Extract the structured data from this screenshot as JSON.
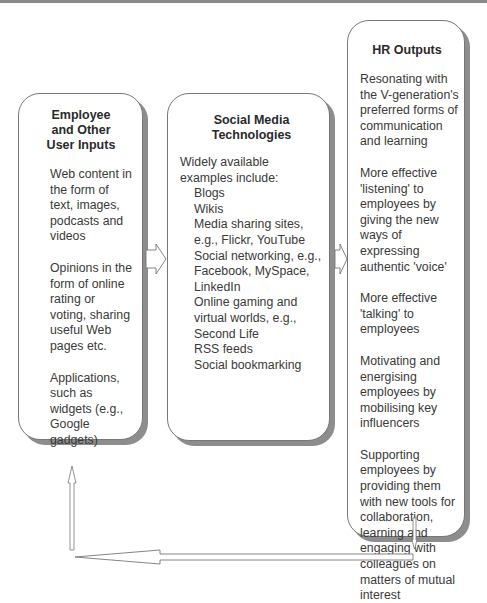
{
  "diagram": {
    "inputs_box": {
      "title": "Employee and Other User Inputs",
      "title_lines": [
        "Employee",
        "and Other",
        "User Inputs"
      ],
      "items": [
        "Web content in the form of text, images, podcasts and videos",
        "Opinions in the form of online rating or voting, sharing useful Web pages etc.",
        "Applications, such as widgets (e.g., Google gadgets)"
      ]
    },
    "tech_box": {
      "title_lines": [
        "Social Media",
        "Technologies"
      ],
      "intro": "Widely available examples include:",
      "examples": [
        "Blogs",
        "Wikis",
        "Media sharing sites, e.g., Flickr, YouTube",
        "Social networking, e.g., Facebook, MySpace, LinkedIn",
        "Online gaming and virtual worlds, e.g., Second Life",
        "RSS feeds",
        "Social bookmarking"
      ]
    },
    "outputs_box": {
      "title": "HR Outputs",
      "items": [
        "Resonating with the V-generation's preferred forms of communication and learning",
        "More effective 'listening' to employees by giving the new ways of expressing authentic 'voice'",
        "More effective 'talking' to employees",
        "Motivating and energising employees by mobilising key influencers",
        "Supporting employees by providing them with new tools for collaboration, learning and engaging with colleagues on matters of mutual interest"
      ]
    },
    "colors": {
      "border": "#777777",
      "shadow": "#8d8d8d",
      "text": "#3a3a3a"
    }
  }
}
